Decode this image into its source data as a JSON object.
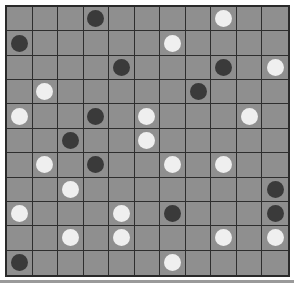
{
  "board": {
    "rows": 11,
    "cols": 11,
    "colors": {
      "cell": "#8f8f8f",
      "grid_line": "#2e2e2e",
      "black_piece": "#3a3a3a",
      "white_piece": "#efefef"
    },
    "pieces": [
      {
        "row": 0,
        "col": 3,
        "color": "black"
      },
      {
        "row": 0,
        "col": 8,
        "color": "white"
      },
      {
        "row": 1,
        "col": 0,
        "color": "black"
      },
      {
        "row": 1,
        "col": 6,
        "color": "white"
      },
      {
        "row": 2,
        "col": 4,
        "color": "black"
      },
      {
        "row": 2,
        "col": 8,
        "color": "black"
      },
      {
        "row": 2,
        "col": 10,
        "color": "white"
      },
      {
        "row": 3,
        "col": 1,
        "color": "white"
      },
      {
        "row": 3,
        "col": 7,
        "color": "black"
      },
      {
        "row": 4,
        "col": 0,
        "color": "white"
      },
      {
        "row": 4,
        "col": 3,
        "color": "black"
      },
      {
        "row": 4,
        "col": 5,
        "color": "white"
      },
      {
        "row": 4,
        "col": 9,
        "color": "white"
      },
      {
        "row": 5,
        "col": 2,
        "color": "black"
      },
      {
        "row": 5,
        "col": 5,
        "color": "white"
      },
      {
        "row": 6,
        "col": 1,
        "color": "white"
      },
      {
        "row": 6,
        "col": 3,
        "color": "black"
      },
      {
        "row": 6,
        "col": 6,
        "color": "white"
      },
      {
        "row": 6,
        "col": 8,
        "color": "white"
      },
      {
        "row": 7,
        "col": 2,
        "color": "white"
      },
      {
        "row": 7,
        "col": 10,
        "color": "black"
      },
      {
        "row": 8,
        "col": 0,
        "color": "white"
      },
      {
        "row": 8,
        "col": 4,
        "color": "white"
      },
      {
        "row": 8,
        "col": 6,
        "color": "black"
      },
      {
        "row": 8,
        "col": 10,
        "color": "black"
      },
      {
        "row": 9,
        "col": 2,
        "color": "white"
      },
      {
        "row": 9,
        "col": 4,
        "color": "white"
      },
      {
        "row": 9,
        "col": 8,
        "color": "white"
      },
      {
        "row": 9,
        "col": 10,
        "color": "white"
      },
      {
        "row": 10,
        "col": 0,
        "color": "black"
      },
      {
        "row": 10,
        "col": 6,
        "color": "white"
      }
    ]
  }
}
